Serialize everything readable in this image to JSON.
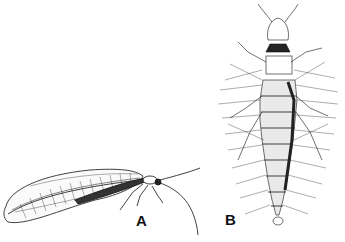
{
  "figure": {
    "panels": [
      {
        "label": "A",
        "subject": "adult lacewing, side view"
      },
      {
        "label": "B",
        "subject": "lacewing larva, dorsal view"
      }
    ],
    "colors": {
      "ink": "#111111",
      "background": "#ffffff"
    }
  }
}
